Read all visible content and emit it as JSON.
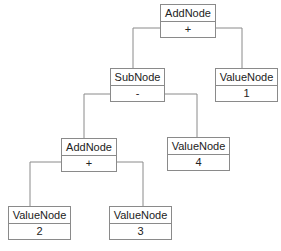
{
  "diagram": {
    "title": "",
    "nodes": [
      {
        "id": "n1",
        "type": "AddNode",
        "value": "+",
        "x": 160,
        "y": 4,
        "w": 56,
        "h": 34
      },
      {
        "id": "n2",
        "type": "SubNode",
        "value": "-",
        "x": 110,
        "y": 68,
        "w": 55,
        "h": 34
      },
      {
        "id": "n3",
        "type": "ValueNode",
        "value": "1",
        "x": 215,
        "y": 68,
        "w": 63,
        "h": 34
      },
      {
        "id": "n4",
        "type": "AddNode",
        "value": "+",
        "x": 61,
        "y": 138,
        "w": 56,
        "h": 34
      },
      {
        "id": "n5",
        "type": "ValueNode",
        "value": "4",
        "x": 167,
        "y": 137,
        "w": 63,
        "h": 34
      },
      {
        "id": "n6",
        "type": "ValueNode",
        "value": "2",
        "x": 8,
        "y": 206,
        "w": 63,
        "h": 34
      },
      {
        "id": "n7",
        "type": "ValueNode",
        "value": "3",
        "x": 109,
        "y": 206,
        "w": 63,
        "h": 34
      }
    ],
    "edges": [
      {
        "from": "n1",
        "to": "n2",
        "points": "160,28 133,28 133,68"
      },
      {
        "from": "n1",
        "to": "n3",
        "points": "216,28 242,28 242,68"
      },
      {
        "from": "n2",
        "to": "n4",
        "points": "110,94 84,94 84,138"
      },
      {
        "from": "n2",
        "to": "n5",
        "points": "165,94 197,94 197,137"
      },
      {
        "from": "n4",
        "to": "n6",
        "points": "61,162 30,162 30,206"
      },
      {
        "from": "n4",
        "to": "n7",
        "points": "117,162 143,162 143,206"
      }
    ],
    "colors": {
      "line": "#8a8a8a",
      "text": "#222222",
      "fill": "#ffffff"
    }
  }
}
